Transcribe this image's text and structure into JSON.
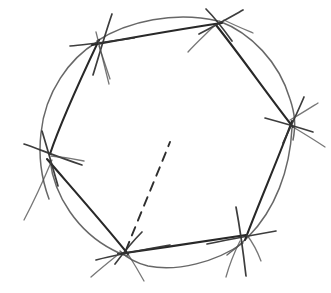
{
  "figure": {
    "title": "Hand-drawn hexagon inscribed in a circle",
    "background_color": "#ffffff",
    "ink_color": "#2b2b2b",
    "circle_color": "#5a5a5a",
    "chord_color": "#282828",
    "dashed_color": "#2e2e2e",
    "canvas": {
      "width": 331,
      "height": 293
    },
    "circle": {
      "label": "circumscribed-circle",
      "center_x": 166,
      "center_y": 142,
      "radius_x": 126,
      "radius_y": 118
    },
    "vertices": [
      {
        "label": "vertex-top-left",
        "x": 98,
        "y": 43
      },
      {
        "label": "vertex-top-right",
        "x": 219,
        "y": 22
      },
      {
        "label": "vertex-right",
        "x": 291,
        "y": 124
      },
      {
        "label": "vertex-bottom-right",
        "x": 244,
        "y": 237
      },
      {
        "label": "vertex-bottom-left",
        "x": 125,
        "y": 252
      },
      {
        "label": "vertex-left",
        "x": 49,
        "y": 157
      }
    ],
    "edges": [
      {
        "label": "edge-top",
        "from": "vertex-top-left",
        "to": "vertex-top-right"
      },
      {
        "label": "edge-upper-right",
        "from": "vertex-top-right",
        "to": "vertex-right"
      },
      {
        "label": "edge-lower-right",
        "from": "vertex-right",
        "to": "vertex-bottom-right"
      },
      {
        "label": "edge-bottom",
        "from": "vertex-bottom-right",
        "to": "vertex-bottom-left"
      },
      {
        "label": "edge-lower-left",
        "from": "vertex-bottom-left",
        "to": "vertex-left"
      },
      {
        "label": "edge-upper-left",
        "from": "vertex-left",
        "to": "vertex-top-left"
      }
    ],
    "dashed_segment": {
      "label": "dashed-interior-segment",
      "from_x": 125,
      "from_y": 250,
      "to_x": 170,
      "to_y": 142,
      "dash_pattern": "9 7"
    },
    "stroke_widths": {
      "circle": 1.5,
      "chord": 2.1,
      "tick": 1.7,
      "dashed": 1.9
    }
  }
}
